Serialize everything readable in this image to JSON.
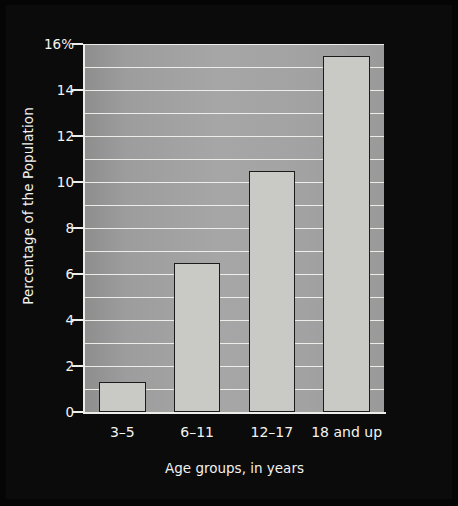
{
  "chart_data": {
    "type": "bar",
    "title": "",
    "subtitle": "",
    "categories": [
      "3–5",
      "6–11",
      "12–17",
      "18 and up"
    ],
    "values": [
      1.3,
      6.5,
      10.5,
      15.5
    ],
    "series": [
      {
        "name": "Percentage of the Population",
        "values": [
          1.3,
          6.5,
          10.5,
          15.5
        ]
      }
    ],
    "xlabel": "Age groups, in years",
    "ylabel": "Percentage of the Population",
    "ylim": [
      0,
      16
    ],
    "ytick_values": [
      0,
      2,
      4,
      6,
      8,
      10,
      12,
      14,
      16
    ],
    "ytick_labels": [
      "0",
      "2",
      "4",
      "6",
      "8",
      "10",
      "12",
      "14",
      "16%"
    ],
    "gridline_values": [
      1,
      2,
      3,
      4,
      5,
      6,
      7,
      8,
      9,
      10,
      11,
      12,
      13,
      14,
      15,
      16
    ],
    "grid": true,
    "legend": false,
    "legend_position": "none",
    "colors": {
      "background": "#0b0b0b",
      "plot_area": "#a0a0a0",
      "bar_fill": "#c9c9c5",
      "bar_outline": "#1b1b1b",
      "gridline": "#f3f3f0",
      "axis": "#ededea",
      "text": "#f4f4f1"
    }
  },
  "axes": {
    "y_title": "Percentage of the Population",
    "x_title": "Age groups, in years"
  },
  "source_note": {
    "text": "Sources: “Data and Statistics on Children’s Mental Health,” Centers for Disease Control and Prevention, accessed November 24, 2021, https://cdc.gov/childrensmentalhealth/data.html; “Understand Anxiety and Depression: Facts & Statistics,” Anxiety and Depression Association of America, accessed November 24, 2021, https://adaa.org/understanding-anxiety/facts-statistics."
  }
}
